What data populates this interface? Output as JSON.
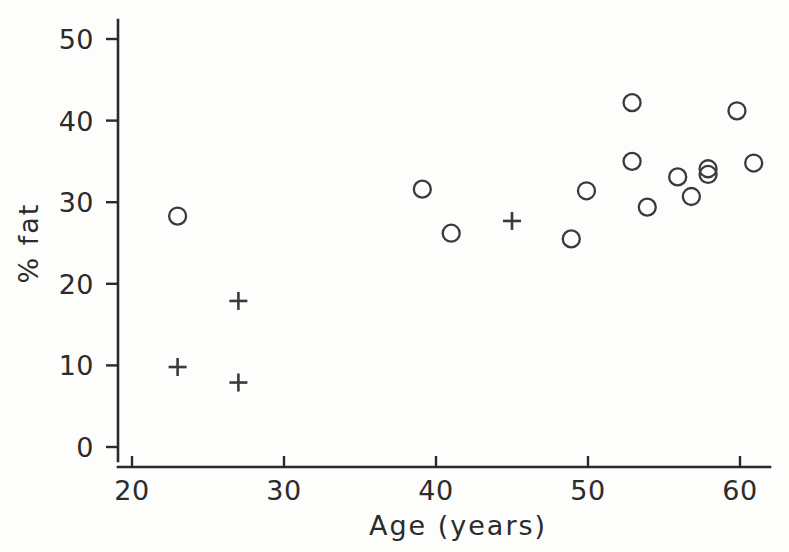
{
  "chart_data": {
    "type": "scatter",
    "title": "",
    "xlabel": "Age (years)",
    "ylabel": "% fat",
    "xlim": [
      19.0,
      62.0
    ],
    "ylim": [
      -1.2,
      51.5
    ],
    "xticks": [
      20,
      30,
      40,
      50,
      60
    ],
    "yticks": [
      0,
      10,
      20,
      30,
      40,
      50
    ],
    "xtick_labels": [
      "20",
      "30",
      "40",
      "50",
      "60"
    ],
    "ytick_labels": [
      "0",
      "10",
      "20",
      "30",
      "40",
      "50"
    ],
    "grid": false,
    "legend": null,
    "series": [
      {
        "name": "circle-group",
        "marker": "circle",
        "color": "#3a3a3a",
        "points": [
          {
            "x": 23.0,
            "y": 28.3
          },
          {
            "x": 39.1,
            "y": 31.6
          },
          {
            "x": 41.0,
            "y": 26.2
          },
          {
            "x": 48.9,
            "y": 25.5
          },
          {
            "x": 49.9,
            "y": 31.4
          },
          {
            "x": 52.9,
            "y": 42.2
          },
          {
            "x": 52.9,
            "y": 35.0
          },
          {
            "x": 53.9,
            "y": 29.4
          },
          {
            "x": 55.9,
            "y": 33.1
          },
          {
            "x": 56.8,
            "y": 30.7
          },
          {
            "x": 57.9,
            "y": 34.1
          },
          {
            "x": 57.9,
            "y": 33.4
          },
          {
            "x": 59.8,
            "y": 41.2
          },
          {
            "x": 60.9,
            "y": 34.8
          }
        ]
      },
      {
        "name": "plus-group",
        "marker": "plus",
        "color": "#3a3a3a",
        "points": [
          {
            "x": 23.0,
            "y": 9.8
          },
          {
            "x": 27.0,
            "y": 17.9
          },
          {
            "x": 27.0,
            "y": 7.9
          },
          {
            "x": 45.0,
            "y": 27.7
          }
        ]
      }
    ]
  },
  "axes": {
    "x_axis_name": "x-axis",
    "y_axis_name": "y-axis"
  }
}
